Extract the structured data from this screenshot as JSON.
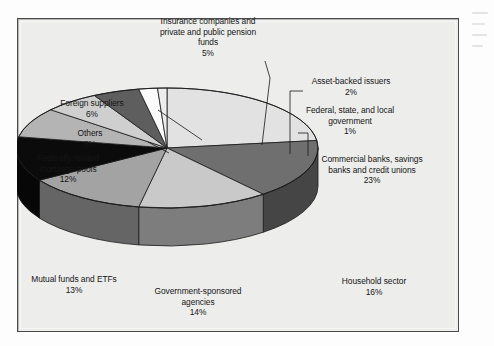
{
  "figure": {
    "background_color": "#ededec",
    "frame_border_color": "#4a4a4a"
  },
  "chart_data": {
    "type": "pie",
    "title": "",
    "subtitle": "",
    "xlabel": "",
    "ylabel": "",
    "legend_position": "none",
    "grid": false,
    "three_d": true,
    "value_unit": "%",
    "start_angle_deg": 0,
    "direction": "clockwise",
    "categories": [
      "Commercial banks, savings banks and credit unions",
      "Household sector",
      "Government-sponsored agencies",
      "Mutual funds and ETFs",
      "Federally related mortgage pools",
      "Others",
      "Foreign suppliers",
      "Insurance companies and private and public pension funds",
      "Asset-backed issuers",
      "Federal, state, and local government"
    ],
    "values": [
      23,
      16,
      14,
      13,
      12,
      8,
      6,
      5,
      2,
      1
    ],
    "slice_colors": [
      "#e2e2e2",
      "#6f6f6f",
      "#c9c9c9",
      "#a3a3a3",
      "#0b0b0b",
      "#b4b4b4",
      "#cfcfcf",
      "#5e5e5e",
      "#fbfbfb",
      "#ededed"
    ],
    "slices": [
      {
        "label": "Commercial banks, savings banks and credit unions",
        "value": 23,
        "display": "23%",
        "color": "#e2e2e2"
      },
      {
        "label": "Household sector",
        "value": 16,
        "display": "16%",
        "color": "#6f6f6f"
      },
      {
        "label": "Government-sponsored agencies",
        "value": 14,
        "display": "14%",
        "color": "#c9c9c9"
      },
      {
        "label": "Mutual funds and ETFs",
        "value": 13,
        "display": "13%",
        "color": "#a3a3a3"
      },
      {
        "label": "Federally related mortgage pools",
        "value": 12,
        "display": "12%",
        "color": "#0b0b0b"
      },
      {
        "label": "Others",
        "value": 8,
        "display": "8%",
        "color": "#b4b4b4"
      },
      {
        "label": "Foreign suppliers",
        "value": 6,
        "display": "6%",
        "color": "#cfcfcf"
      },
      {
        "label": "Insurance companies and private and public pension funds",
        "value": 5,
        "display": "5%",
        "color": "#5e5e5e"
      },
      {
        "label": "Asset-backed issuers",
        "value": 2,
        "display": "2%",
        "color": "#fbfbfb"
      },
      {
        "label": "Federal, state, and local government",
        "value": 1,
        "display": "1%",
        "color": "#ededed"
      }
    ]
  },
  "labels": {
    "insurance": {
      "name": "Insurance companies and\nprivate and public pension\nfunds",
      "pct": "5%"
    },
    "asset_backed": {
      "name": "Asset-backed issuers",
      "pct": "2%"
    },
    "fed_state_local": {
      "name": "Federal, state, and local\ngovernment",
      "pct": "1%"
    },
    "commercial_banks": {
      "name": "Commercial banks, savings\nbanks and credit unions",
      "pct": "23%"
    },
    "household": {
      "name": "Household sector",
      "pct": "16%"
    },
    "gse_agencies": {
      "name": "Government-sponsored\nagencies",
      "pct": "14%"
    },
    "mutual_funds": {
      "name": "Mutual funds and ETFs",
      "pct": "13%"
    },
    "mortgage_pools": {
      "name": "Federally related\nmortgage pools",
      "pct": "12%"
    },
    "others": {
      "name": "Others",
      "pct": "8%"
    },
    "foreign_suppliers": {
      "name": "Foreign suppliers",
      "pct": "6%"
    }
  }
}
